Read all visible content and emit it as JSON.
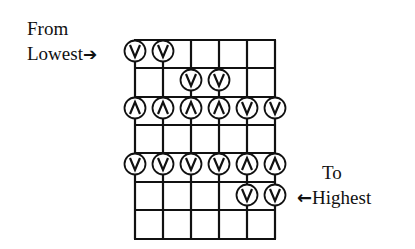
{
  "labels": {
    "from_line1": "From",
    "from_line2": "Lowest",
    "to_line1": "To",
    "to_line2": "Highest",
    "arrow_right": "➔",
    "arrow_left": "←"
  },
  "grid": {
    "strings": 6,
    "x": [
      135,
      163,
      191,
      219,
      247,
      275
    ],
    "y_lines": [
      40,
      68,
      97,
      125,
      153,
      182,
      210,
      239
    ],
    "line_color": "#111111"
  },
  "markers": [
    {
      "y": 51,
      "string": 0,
      "stroke": "down"
    },
    {
      "y": 51,
      "string": 1,
      "stroke": "down"
    },
    {
      "y": 80,
      "string": 2,
      "stroke": "down"
    },
    {
      "y": 80,
      "string": 3,
      "stroke": "down"
    },
    {
      "y": 108,
      "string": 0,
      "stroke": "up"
    },
    {
      "y": 108,
      "string": 1,
      "stroke": "up"
    },
    {
      "y": 108,
      "string": 2,
      "stroke": "up"
    },
    {
      "y": 108,
      "string": 3,
      "stroke": "up"
    },
    {
      "y": 108,
      "string": 4,
      "stroke": "down"
    },
    {
      "y": 108,
      "string": 5,
      "stroke": "down"
    },
    {
      "y": 164,
      "string": 0,
      "stroke": "down"
    },
    {
      "y": 164,
      "string": 1,
      "stroke": "down"
    },
    {
      "y": 164,
      "string": 2,
      "stroke": "down"
    },
    {
      "y": 164,
      "string": 3,
      "stroke": "down"
    },
    {
      "y": 164,
      "string": 4,
      "stroke": "up"
    },
    {
      "y": 164,
      "string": 5,
      "stroke": "up"
    },
    {
      "y": 195,
      "string": 4,
      "stroke": "down"
    },
    {
      "y": 195,
      "string": 5,
      "stroke": "down"
    }
  ]
}
